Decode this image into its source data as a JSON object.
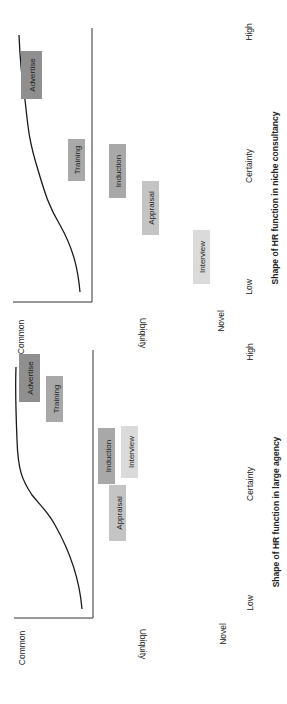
{
  "panels": [
    {
      "id": "niche-consultancy",
      "title": "Shape of HR function in niche consultancy",
      "y_axis": {
        "label": "Ubiquity",
        "top": "Common",
        "bottom": "Novel"
      },
      "x_axis": {
        "label": "Certainty",
        "left": "Low",
        "right": "High"
      },
      "labels": [
        {
          "text": "Advertise",
          "shade": "#8f8f8f"
        },
        {
          "text": "Training",
          "shade": "#a8a8a8"
        },
        {
          "text": "Induction",
          "shade": "#a8a8a8"
        },
        {
          "text": "Appraisal",
          "shade": "#c4c4c4"
        },
        {
          "text": "Interview",
          "shade": "#dadada"
        }
      ]
    },
    {
      "id": "large-agency",
      "title": "Shape of HR function in large agency",
      "y_axis": {
        "label": "Ubiquity",
        "top": "Common",
        "bottom": "Novel"
      },
      "x_axis": {
        "label": "Certainty",
        "left": "Low",
        "right": "High"
      },
      "labels": [
        {
          "text": "Advertise",
          "shade": "#8f8f8f"
        },
        {
          "text": "Training",
          "shade": "#a8a8a8"
        },
        {
          "text": "Induction",
          "shade": "#a8a8a8"
        },
        {
          "text": "Interview",
          "shade": "#dadada"
        },
        {
          "text": "Appraisal",
          "shade": "#c4c4c4"
        }
      ]
    }
  ]
}
